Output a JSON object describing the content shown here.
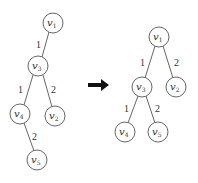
{
  "diagram": {
    "type": "tree-transformation",
    "left_tree": {
      "nodes": [
        {
          "id": "v1",
          "label": "v",
          "sub": "1",
          "x": 53,
          "y": 23
        },
        {
          "id": "v3",
          "label": "v",
          "sub": "3",
          "x": 38,
          "y": 66
        },
        {
          "id": "v4",
          "label": "v",
          "sub": "4",
          "x": 20,
          "y": 114
        },
        {
          "id": "v2",
          "label": "v",
          "sub": "2",
          "x": 55,
          "y": 116
        },
        {
          "id": "v5",
          "label": "v",
          "sub": "5",
          "x": 37,
          "y": 160
        }
      ],
      "edges": [
        {
          "from": "v1",
          "to": "v3",
          "weight": "1"
        },
        {
          "from": "v3",
          "to": "v4",
          "weight": "1"
        },
        {
          "from": "v3",
          "to": "v2",
          "weight": "2"
        },
        {
          "from": "v4",
          "to": "v5",
          "weight": "2"
        }
      ]
    },
    "arrow": {
      "direction": "right",
      "color": "#111111"
    },
    "right_tree": {
      "nodes": [
        {
          "id": "v1",
          "label": "v",
          "sub": "1",
          "x": 159,
          "y": 37
        },
        {
          "id": "v3",
          "label": "v",
          "sub": "3",
          "x": 142,
          "y": 87
        },
        {
          "id": "v2",
          "label": "v",
          "sub": "2",
          "x": 176,
          "y": 87
        },
        {
          "id": "v4",
          "label": "v",
          "sub": "4",
          "x": 125,
          "y": 132
        },
        {
          "id": "v5",
          "label": "v",
          "sub": "5",
          "x": 158,
          "y": 132
        }
      ],
      "edges": [
        {
          "from": "v1",
          "to": "v3",
          "weight": "1"
        },
        {
          "from": "v1",
          "to": "v2",
          "weight": "2"
        },
        {
          "from": "v3",
          "to": "v4",
          "weight": "1"
        },
        {
          "from": "v3",
          "to": "v5",
          "weight": "2"
        }
      ]
    }
  }
}
